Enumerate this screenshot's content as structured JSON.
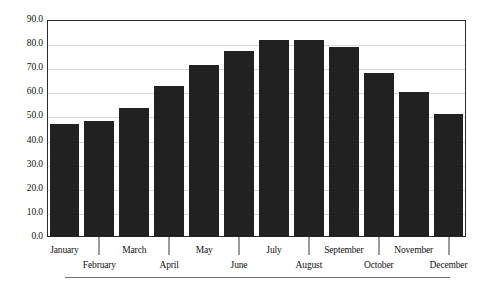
{
  "chart_data": {
    "type": "bar",
    "title": "",
    "subtitle": "",
    "xlabel": "",
    "ylabel": "",
    "categories": [
      "January",
      "February",
      "March",
      "April",
      "May",
      "June",
      "July",
      "August",
      "September",
      "October",
      "November",
      "December"
    ],
    "values": [
      46.8,
      48.3,
      53.6,
      62.8,
      71.5,
      77.3,
      81.7,
      81.6,
      79.0,
      68.0,
      60.0,
      51.0
    ],
    "series": [
      {
        "name": "",
        "values": [
          46.8,
          48.3,
          53.6,
          62.8,
          71.5,
          77.3,
          81.7,
          81.6,
          79.0,
          68.0,
          60.0,
          51.0
        ]
      }
    ],
    "ylim": [
      0.0,
      90.0
    ],
    "ytick_step": 10.0,
    "ytick_labels": [
      "0.0",
      "10.0",
      "20.0",
      "30.0",
      "40.0",
      "50.0",
      "60.0",
      "70.0",
      "80.0",
      "90.0"
    ],
    "ytick_values": [
      0.0,
      10.0,
      20.0,
      30.0,
      40.0,
      50.0,
      60.0,
      70.0,
      80.0,
      90.0
    ],
    "xtick_labels": [
      "January",
      "February",
      "March",
      "April",
      "May",
      "June",
      "July",
      "August",
      "September",
      "October",
      "November",
      "December"
    ],
    "grid": true,
    "grid_axis": "y",
    "legend": false,
    "legend_position": "none",
    "bar_color": "#181818",
    "grid_color": "#d9d9d9",
    "frame_color": "#2b2b2b",
    "background_color": "#ffffff",
    "label_stagger": true,
    "annotations": []
  }
}
